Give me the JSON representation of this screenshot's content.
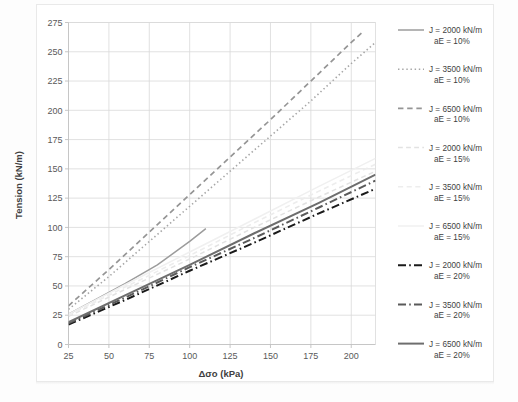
{
  "chart_data": {
    "type": "line",
    "title": "",
    "xlabel": "Δσo (kPa)",
    "ylabel": "Tension (kN/m)",
    "xlim": [
      25,
      215
    ],
    "ylim": [
      0,
      275
    ],
    "xticks": [
      25,
      50,
      75,
      100,
      125,
      150,
      175,
      200
    ],
    "yticks": [
      0,
      25,
      50,
      75,
      100,
      125,
      150,
      175,
      200,
      225,
      250,
      275
    ],
    "grid": true,
    "legend_position": "right",
    "series": [
      {
        "name": "J = 2000 kN/m aE = 10%",
        "label_line1": "J = 2000 kN/m",
        "label_line2": "aE = 10%",
        "style": "solid",
        "color": "#9c9c9c",
        "width": 1.5,
        "x": [
          25,
          40,
          60,
          80,
          100,
          110
        ],
        "y": [
          26,
          37,
          52,
          68,
          88,
          99
        ]
      },
      {
        "name": "J = 3500 kN/m aE = 10%",
        "label_line1": "J = 3500 kN/m",
        "label_line2": "aE = 10%",
        "style": "dotted",
        "color": "#a6a6a6",
        "width": 1.6,
        "x": [
          25,
          50,
          75,
          100,
          125,
          150,
          175,
          200,
          215
        ],
        "y": [
          30,
          58,
          88,
          118,
          148,
          178,
          208,
          240,
          258
        ]
      },
      {
        "name": "J = 6500 kN/m aE = 10%",
        "label_line1": "J = 6500 kN/m",
        "label_line2": "aE = 10%",
        "style": "dashed",
        "color": "#959595",
        "width": 1.7,
        "x": [
          25,
          50,
          75,
          100,
          125,
          150,
          175,
          200,
          208
        ],
        "y": [
          33,
          64,
          96,
          128,
          160,
          192,
          225,
          258,
          268
        ]
      },
      {
        "name": "J = 2000 kN/m aE = 15%",
        "label_line1": "J = 2000 kN/m",
        "label_line2": "aE = 15%",
        "style": "dashed",
        "color": "#e2e2e2",
        "width": 1.5,
        "x": [
          25,
          60,
          100,
          140,
          180,
          215
        ],
        "y": [
          24,
          47,
          73,
          100,
          126,
          148
        ]
      },
      {
        "name": "J = 3500 kN/m aE = 15%",
        "label_line1": "J = 3500 kN/m",
        "label_line2": "aE = 15%",
        "style": "dashed",
        "color": "#ededed",
        "width": 1.6,
        "x": [
          25,
          60,
          100,
          140,
          180,
          215
        ],
        "y": [
          25,
          49,
          76,
          104,
          131,
          154
        ]
      },
      {
        "name": "J = 6500 kN/m aE = 15%",
        "label_line1": "J = 6500 kN/m",
        "label_line2": "aE = 15%",
        "style": "solid",
        "color": "#f0f0f0",
        "width": 1.5,
        "x": [
          25,
          60,
          100,
          140,
          180,
          215
        ],
        "y": [
          26,
          51,
          79,
          107,
          135,
          159
        ]
      },
      {
        "name": "J = 2000 kN/m aE = 20%",
        "label_line1": "J = 2000 kN/m",
        "label_line2": "aE = 20%",
        "style": "dashdot",
        "color": "#1a1a1a",
        "width": 2.0,
        "x": [
          25,
          60,
          100,
          140,
          180,
          215
        ],
        "y": [
          17,
          38,
          63,
          87,
          112,
          133
        ]
      },
      {
        "name": "J = 3500 kN/m aE = 20%",
        "label_line1": "J = 3500 kN/m",
        "label_line2": "aE = 20%",
        "style": "dashdot",
        "color": "#5a5a5a",
        "width": 2.0,
        "x": [
          25,
          60,
          100,
          140,
          180,
          215
        ],
        "y": [
          18,
          40,
          66,
          91,
          117,
          140
        ]
      },
      {
        "name": "J = 6500 kN/m aE = 20%",
        "label_line1": "J = 6500 kN/m",
        "label_line2": "aE = 20%",
        "style": "solid",
        "color": "#6e6e6e",
        "width": 2.0,
        "x": [
          25,
          60,
          100,
          140,
          180,
          215
        ],
        "y": [
          19,
          42,
          68,
          95,
          121,
          145
        ]
      }
    ]
  },
  "axes": {
    "y_title": "Tension (kN/m)",
    "x_title": "Δσo (kPa)",
    "ytick_labels": [
      "275",
      "250",
      "225",
      "200",
      "175",
      "150",
      "125",
      "100",
      "75",
      "50",
      "25",
      "0"
    ],
    "xtick_labels": [
      "25",
      "50",
      "75",
      "100",
      "125",
      "150",
      "175",
      "200"
    ]
  },
  "legend": {
    "entries": [
      {
        "line1": "J = 2000 kN/m",
        "line2": "aE = 10%",
        "swatch": "solid-gray"
      },
      {
        "line1": "J = 3500 kN/m",
        "line2": "aE = 10%",
        "swatch": "dotted-gray"
      },
      {
        "line1": "J = 6500 kN/m",
        "line2": "aE = 10%",
        "swatch": "dashed-gray"
      },
      {
        "line1": "J = 2000 kN/m",
        "line2": "aE = 15%",
        "swatch": "dashed-lightgray"
      },
      {
        "line1": "J = 3500 kN/m",
        "line2": "aE = 15%",
        "swatch": "dashed-verylightgray"
      },
      {
        "line1": "J = 6500 kN/m",
        "line2": "aE = 15%",
        "swatch": "solid-verylightgray"
      },
      {
        "line1": "J = 2000 kN/m",
        "line2": "aE = 20%",
        "swatch": "dashdot-black"
      },
      {
        "line1": "J = 3500 kN/m",
        "line2": "aE = 20%",
        "swatch": "dashdot-darkgray"
      },
      {
        "line1": "J = 6500 kN/m",
        "line2": "aE = 20%",
        "swatch": "solid-darkgray"
      }
    ]
  },
  "colors": {
    "grid": "#d9d9d9",
    "axis": "#bfbfbf",
    "text": "#595959",
    "background": "#ffffff",
    "page": "#fdfdfd"
  }
}
